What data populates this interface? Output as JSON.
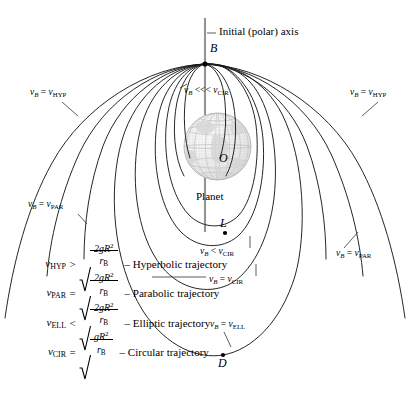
{
  "figure": {
    "type": "orbital-trajectory-diagram",
    "axis_label": "Initial (polar) axis",
    "planet_label": "Planet",
    "points": [
      {
        "id": "B",
        "label": "B",
        "x": 205,
        "y": 64
      },
      {
        "id": "O",
        "label": "O",
        "x": 222,
        "y": 163
      },
      {
        "id": "L",
        "label": "L",
        "x": 225,
        "y": 233
      },
      {
        "id": "D",
        "label": "D",
        "x": 223,
        "y": 355
      }
    ],
    "curve_labels": [
      {
        "id": "hyp-left",
        "text": "v_B = v_HYP",
        "v": "v",
        "subv": "B",
        "rel": "=",
        "w": "v",
        "subw": "HYP",
        "x": 30,
        "y": 93
      },
      {
        "id": "hyp-right",
        "text": "v_B = v_HYP",
        "v": "v",
        "subv": "B",
        "rel": "=",
        "w": "v",
        "subw": "HYP",
        "x": 350,
        "y": 93
      },
      {
        "id": "tiny",
        "text": "v_B <<< v_CIR",
        "v": "v",
        "subv": "B",
        "rel": "<<<",
        "w": "v",
        "subw": "CIR",
        "x": 182,
        "y": 90
      },
      {
        "id": "par-left",
        "text": "v_B = v_PAR",
        "v": "v",
        "subv": "B",
        "rel": "=",
        "w": "v",
        "subw": "PAR",
        "x": 28,
        "y": 205
      },
      {
        "id": "par-right",
        "text": "v_B = v_PAR",
        "v": "v",
        "subv": "B",
        "rel": "=",
        "w": "v",
        "subw": "PAR",
        "x": 336,
        "y": 254
      },
      {
        "id": "lt-cir",
        "text": "v_B < v_CIR",
        "v": "v",
        "subv": "B",
        "rel": "<",
        "w": "v",
        "subw": "CIR",
        "x": 199,
        "y": 250
      },
      {
        "id": "eq-cir",
        "text": "v_B = v_CIR",
        "v": "v",
        "subv": "B",
        "rel": "=",
        "w": "v",
        "subw": "CIR",
        "x": 208,
        "y": 278
      },
      {
        "id": "eq-ell",
        "text": "v_B = v_ELL",
        "v": "v",
        "subv": "B",
        "rel": "=",
        "w": "v",
        "subw": "ELL",
        "x": 209,
        "y": 323
      }
    ],
    "equations": [
      {
        "lhs": "v",
        "lhs_sub": "HYP",
        "rel": ">",
        "coef": "2",
        "num": "2gR",
        "num_exp": "2",
        "den": "r",
        "den_sub": "B",
        "desc": "– Hyperbolic trajectory"
      },
      {
        "lhs": "v",
        "lhs_sub": "PAR",
        "rel": "=",
        "coef": "2",
        "num": "2gR",
        "num_exp": "2",
        "den": "r",
        "den_sub": "B",
        "desc": "– Parabolic trajectory"
      },
      {
        "lhs": "v",
        "lhs_sub": "ELL",
        "rel": "<",
        "coef": "2",
        "num": "2gR",
        "num_exp": "2",
        "den": "r",
        "den_sub": "B",
        "desc": "– Elliptic trajectory"
      },
      {
        "lhs": "v",
        "lhs_sub": "CIR",
        "rel": "=",
        "coef": "",
        "num": "gR",
        "num_exp": "2",
        "den": "r",
        "den_sub": "B",
        "desc": "– Circular trajectory"
      }
    ],
    "colors": {
      "curve": "#1a1a1a",
      "axis": "#8c8c8c",
      "globe_fill": "#efefef",
      "globe_line": "#bdbdbd",
      "text": "#000000"
    }
  }
}
